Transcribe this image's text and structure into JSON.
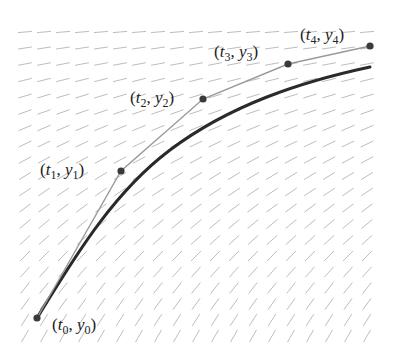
{
  "diagram": {
    "colors": {
      "slope_field": "#bdbdbd",
      "exact_curve": "#2a2a2a",
      "euler_polyline": "#9a9a9a",
      "points": "#3a3a3a",
      "text": "#222222"
    },
    "slope_field": {
      "x_start": 25,
      "x_end": 385,
      "x_step": 19,
      "y_start": 32,
      "y_end": 336,
      "y_step": 16,
      "seg_len": 14
    },
    "points": [
      {
        "id": "p0",
        "label_t": "t",
        "label_y": "y",
        "sub": "0",
        "x": 37,
        "y": 318,
        "label_x": 52,
        "label_y_pos": 330
      },
      {
        "id": "p1",
        "label_t": "t",
        "label_y": "y",
        "sub": "1",
        "x": 121,
        "y": 171,
        "label_x": 40,
        "label_y_pos": 175
      },
      {
        "id": "p2",
        "label_t": "t",
        "label_y": "y",
        "sub": "2",
        "x": 203,
        "y": 99,
        "label_x": 130,
        "label_y_pos": 103
      },
      {
        "id": "p3",
        "label_t": "t",
        "label_y": "y",
        "sub": "3",
        "x": 288,
        "y": 64,
        "label_x": 214,
        "label_y_pos": 57
      },
      {
        "id": "p4",
        "label_t": "t",
        "label_y": "y",
        "sub": "4",
        "x": 370,
        "y": 46,
        "label_x": 300,
        "label_y_pos": 40
      }
    ],
    "labels": [
      "(t0, y0)",
      "(t1, y1)",
      "(t2, y2)",
      "(t3, y3)",
      "(t4, y4)"
    ],
    "exact_curve_path": "M37,318 C70,265 110,195 170,150 C230,105 300,82 370,67"
  }
}
